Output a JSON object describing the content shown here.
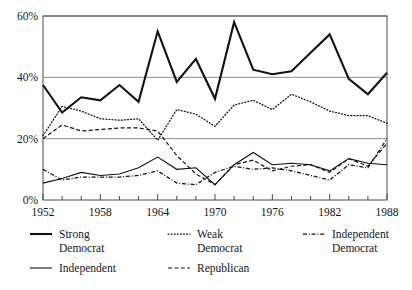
{
  "chart_data": {
    "type": "line",
    "title": "",
    "xlabel": "",
    "ylabel": "",
    "xlim": [
      1952,
      1988
    ],
    "ylim": [
      0,
      60
    ],
    "yticks": [
      0,
      20,
      40,
      60
    ],
    "ytick_labels": [
      "0%",
      "20%",
      "40%",
      "60%"
    ],
    "x": [
      1952,
      1954,
      1956,
      1958,
      1960,
      1962,
      1964,
      1966,
      1968,
      1970,
      1972,
      1974,
      1976,
      1978,
      1980,
      1982,
      1984,
      1986,
      1988
    ],
    "xtick_labels": [
      "1952",
      "1958",
      "1964",
      "1970",
      "1976",
      "1982",
      "1988"
    ],
    "xticks_labeled": [
      1952,
      1958,
      1964,
      1970,
      1976,
      1982,
      1988
    ],
    "grid": true,
    "grid_axis": "y",
    "legend_position": "below",
    "series": [
      {
        "name": "Strong Democrat",
        "label": "Strong\nDemocrat",
        "style": "solid-thick",
        "color": "#111111",
        "values": [
          37.5,
          28.5,
          33.5,
          32.5,
          37.5,
          32,
          55,
          38.5,
          46,
          33,
          58,
          42.5,
          41,
          42,
          48,
          54,
          39.5,
          34.5,
          41.5
        ]
      },
      {
        "name": "Weak Democrat",
        "label": "Weak\nDemocrat",
        "style": "dotted",
        "color": "#111111",
        "values": [
          21,
          30.5,
          29,
          26.5,
          26,
          26.5,
          19.5,
          29.5,
          28,
          24,
          31,
          32.5,
          29.5,
          34.5,
          32,
          29,
          27.5,
          27.5,
          25
        ]
      },
      {
        "name": "Independent Democrat",
        "label": "Independent\nDemocrat",
        "style": "dash-dot",
        "color": "#111111",
        "values": [
          10,
          6.5,
          7.5,
          7.5,
          7.5,
          8,
          9.5,
          5.5,
          5,
          9,
          11,
          10,
          10.5,
          9.5,
          8,
          6.5,
          11.5,
          10.5,
          20
        ]
      },
      {
        "name": "Independent",
        "label": "Independent",
        "style": "solid-thin",
        "color": "#111111",
        "values": [
          5.5,
          7,
          9,
          8,
          8.5,
          10.5,
          14,
          10,
          10.5,
          5,
          11.5,
          15.5,
          11.5,
          12,
          11.5,
          9.5,
          13.5,
          12,
          11.5
        ]
      },
      {
        "name": "Republican",
        "label": "Republican",
        "style": "dashed",
        "color": "#111111",
        "values": [
          20,
          24.5,
          22.5,
          23,
          23.5,
          23.5,
          22.5,
          14.5,
          8.5,
          5,
          11.5,
          13,
          9.5,
          11,
          11.5,
          9,
          13.5,
          11,
          18.5
        ]
      }
    ]
  },
  "legend": {
    "entries": [
      {
        "name": "Strong Democrat",
        "line1": "Strong",
        "line2": "Democrat",
        "style": "solid-thick"
      },
      {
        "name": "Weak Democrat",
        "line1": "Weak",
        "line2": "Democrat",
        "style": "dotted"
      },
      {
        "name": "Independent Democrat",
        "line1": "Independent",
        "line2": "Democrat",
        "style": "dash-dot"
      },
      {
        "name": "Independent",
        "line1": "Independent",
        "line2": "",
        "style": "solid-thin"
      },
      {
        "name": "Republican",
        "line1": "Republican",
        "line2": "",
        "style": "dashed"
      }
    ]
  }
}
